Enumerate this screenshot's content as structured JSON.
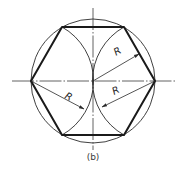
{
  "figure": {
    "caption": "(b)",
    "labels": {
      "radius_upper_right": "R",
      "radius_lower_left": "R",
      "radius_lower_right": "R"
    },
    "geometry": {
      "center": [
        93,
        81
      ],
      "circle_radius": 62,
      "hexagon_vertices": [
        [
          31,
          81
        ],
        [
          62,
          27
        ],
        [
          124,
          27
        ],
        [
          155,
          81
        ],
        [
          124,
          135
        ],
        [
          62,
          135
        ]
      ],
      "construction_arcs": [
        {
          "center": [
            31,
            81
          ],
          "radius": 62,
          "from": [
            62,
            27
          ],
          "to": [
            62,
            135
          ]
        },
        {
          "center": [
            155,
            81
          ],
          "radius": 62,
          "from": [
            124,
            27
          ],
          "to": [
            124,
            135
          ]
        }
      ],
      "horizontal_centerline": {
        "x1": 12,
        "x2": 175,
        "y": 81
      },
      "vertical_centerline": {
        "x": 93,
        "y1": 8,
        "y2": 150
      }
    },
    "colors": {
      "stroke": "#1a1a1a",
      "background": "#ffffff"
    }
  }
}
